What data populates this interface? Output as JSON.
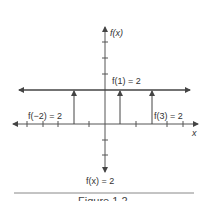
{
  "figure": {
    "y_axis_label": "f(x)",
    "x_axis_label": "x",
    "function_label": "f(x) = 2",
    "caption": "Figure 1.2",
    "annotations": [
      {
        "text": "f(−2) = 2",
        "x_value": -2
      },
      {
        "text": "f(1) = 2",
        "x_value": 1
      },
      {
        "text": "f(3) = 2",
        "x_value": 3
      }
    ],
    "constant_value": 2,
    "x_ticks": [
      -6,
      -5,
      -4,
      -3,
      -2,
      -1,
      0,
      1,
      2,
      3,
      4,
      5
    ],
    "y_ticks_above": [
      1,
      2,
      3,
      4
    ],
    "y_ticks_below": [
      -1,
      -2
    ],
    "colors": {
      "axis": "#555555",
      "function_line": "#444444",
      "text": "#333333",
      "rule": "#888888"
    }
  }
}
